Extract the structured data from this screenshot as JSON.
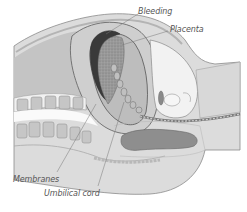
{
  "figure": {
    "style": "grayscale pencil illustration",
    "labels": [
      {
        "id": "bleeding",
        "text": "Bleeding"
      },
      {
        "id": "placenta",
        "text": "Placenta"
      },
      {
        "id": "membranes",
        "text": "Membranes"
      },
      {
        "id": "umbilical_cord",
        "text": "Umbilical cord"
      }
    ]
  },
  "colors": {
    "background": "#ffffff",
    "tissue_light": "#e6e6e6",
    "tissue_mid": "#c8c8c8",
    "tissue_dark": "#a8a8a8",
    "blood_clot": "#3a3a3a",
    "outline": "#6a6a6a",
    "label_text": "#555555",
    "leader_line": "#777777"
  }
}
